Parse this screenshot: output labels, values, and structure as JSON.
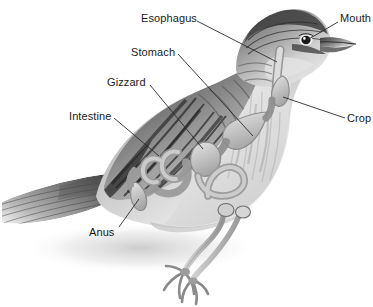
{
  "diagram": {
    "background_color": "#ffffff",
    "style": "grayscale pencil illustration",
    "width": 373,
    "height": 307
  },
  "labels": [
    {
      "id": "esophagus",
      "text": "Esophagus",
      "x": 141,
      "y": 12,
      "line": {
        "x1": 197,
        "y1": 21,
        "x2": 277,
        "y2": 62
      }
    },
    {
      "id": "stomach",
      "text": "Stomach",
      "x": 131,
      "y": 46,
      "line": {
        "x1": 178,
        "y1": 54,
        "x2": 253,
        "y2": 136
      }
    },
    {
      "id": "gizzard",
      "text": "Gizzard",
      "x": 107,
      "y": 76,
      "line": {
        "x1": 150,
        "y1": 85,
        "x2": 203,
        "y2": 149
      }
    },
    {
      "id": "intestine",
      "text": "Intestine",
      "x": 69,
      "y": 110,
      "line": {
        "x1": 114,
        "y1": 118,
        "x2": 159,
        "y2": 156
      }
    },
    {
      "id": "anus",
      "text": "Anus",
      "x": 89,
      "y": 226,
      "line": {
        "x1": 119,
        "y1": 227,
        "x2": 139,
        "y2": 199
      }
    },
    {
      "id": "mouth",
      "text": "Mouth",
      "x": 340,
      "y": 12,
      "line": {
        "x1": 338,
        "y1": 22,
        "x2": 307,
        "y2": 40
      }
    },
    {
      "id": "crop",
      "text": "Crop",
      "x": 347,
      "y": 112,
      "line": {
        "x1": 345,
        "y1": 118,
        "x2": 283,
        "y2": 97
      }
    }
  ],
  "colors": {
    "line": "#2b2b2b",
    "text": "#1a1a1a",
    "body_light": "#e8e8e8",
    "body_mid": "#b9b9b9",
    "body_dark": "#6a6a6a",
    "wing_dark": "#4a4a4a",
    "organ": "#c9c9c9",
    "organ_outline": "#8d8d8d",
    "shadow": "#dcdcdc"
  }
}
